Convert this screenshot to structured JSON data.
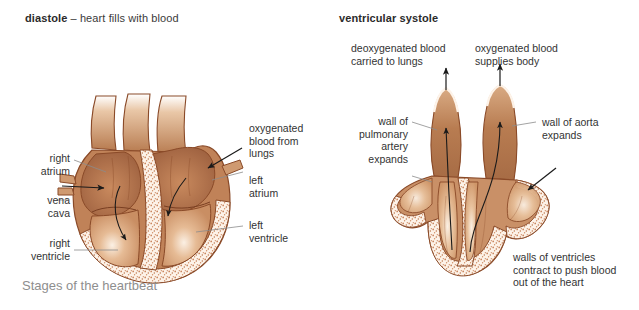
{
  "figure": {
    "caption": "Stages of the heartbeat",
    "background": "#ffffff",
    "label_color": "#333333",
    "caption_color": "#8e8e8e"
  },
  "panels": [
    {
      "id": "diastole",
      "title_bold": "diastole",
      "title_rest": " – heart fills with blood",
      "labels": [
        {
          "name": "right-atrium",
          "text": "right\natrium",
          "align": "right"
        },
        {
          "name": "vena-cava",
          "text": "vena\ncava",
          "align": "right"
        },
        {
          "name": "right-ventricle",
          "text": "right\nventricle",
          "align": "right"
        },
        {
          "name": "oxygenated-blood-from-lungs",
          "text": "oxygenated\nblood from\nlungs",
          "align": "left"
        },
        {
          "name": "left-atrium",
          "text": "left\natrium",
          "align": "left"
        },
        {
          "name": "left-ventricle",
          "text": "left\nventricle",
          "align": "left"
        }
      ]
    },
    {
      "id": "ventricular-systole",
      "title_bold": "ventricular systole",
      "title_rest": "",
      "labels": [
        {
          "name": "deoxygenated-blood-carried-to-lungs",
          "text": "deoxygenated blood\ncarried to lungs",
          "align": "left"
        },
        {
          "name": "oxygenated-blood-supplies-body",
          "text": "oxygenated blood\nsupplies body",
          "align": "left"
        },
        {
          "name": "wall-of-pulmonary-artery-expands",
          "text": "wall of\npulmonary\nartery\nexpands",
          "align": "right"
        },
        {
          "name": "wall-of-aorta-expands",
          "text": "wall of aorta\nexpands",
          "align": "left"
        },
        {
          "name": "walls-of-ventricles-contract",
          "text": "walls of ventricles\ncontract to push blood\nout of the heart",
          "align": "left"
        }
      ]
    }
  ],
  "artwork": {
    "chamber_fill_dark": "#9c5f3e",
    "chamber_fill_mid": "#b8794f",
    "chamber_fill_light": "#e0b48c",
    "muscle_fill": "#f6e3d2",
    "outline": "#8a4a28",
    "stipple": "#c8835a",
    "arrow_color": "#1a1a1a",
    "leader_color": "#8c8c8c"
  }
}
